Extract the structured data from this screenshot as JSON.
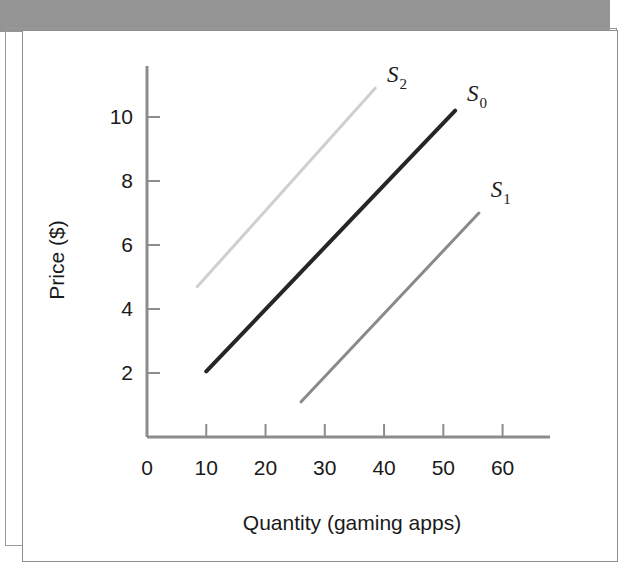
{
  "figure": {
    "header_title": "SHIFTS IN THE SUPPLY CURVE",
    "header_color": "#949494",
    "frame_color": "#9a9a9a"
  },
  "chart_data": {
    "type": "line",
    "title": "SHIFTS IN THE SUPPLY CURVE",
    "xlabel": "Quantity (gaming apps)",
    "ylabel": "Price ($)",
    "xlim": [
      0,
      68
    ],
    "ylim": [
      0,
      11.5
    ],
    "xticks": [
      0,
      10,
      20,
      30,
      40,
      50,
      60
    ],
    "xtick_labels": [
      "0",
      "10",
      "20",
      "30",
      "40",
      "50",
      "60"
    ],
    "yticks": [
      2,
      4,
      6,
      8,
      10
    ],
    "ytick_labels": [
      "2",
      "4",
      "6",
      "8",
      "10"
    ],
    "grid": false,
    "legend_position": "inline-end-labels",
    "series": [
      {
        "name": "S2",
        "label": "S",
        "subscript": "2",
        "color": "#cfcfcf",
        "linewidth": 3,
        "x": [
          8.5,
          38.5
        ],
        "y": [
          4.7,
          10.9
        ],
        "label_x": 40.5,
        "label_y": 11.1
      },
      {
        "name": "S0",
        "label": "S",
        "subscript": "0",
        "color": "#262626",
        "linewidth": 4,
        "x": [
          10.0,
          52.0
        ],
        "y": [
          2.05,
          10.2
        ],
        "label_x": 54.0,
        "label_y": 10.5
      },
      {
        "name": "S1",
        "label": "S",
        "subscript": "1",
        "color": "#8a8a8a",
        "linewidth": 3,
        "x": [
          26.0,
          56.0
        ],
        "y": [
          1.1,
          7.0
        ],
        "label_x": 58.0,
        "label_y": 7.5
      }
    ]
  }
}
